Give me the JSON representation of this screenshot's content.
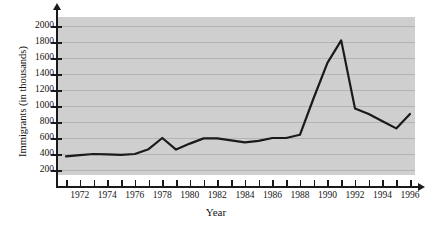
{
  "chart_data": {
    "type": "line",
    "title": "",
    "xlabel": "Year",
    "ylabel": "Immigrants (in thousands)",
    "xlim": [
      1970.5,
      1996.5
    ],
    "ylim": [
      0,
      2100
    ],
    "grid": true,
    "legend": null,
    "y_ticks": [
      200,
      400,
      600,
      800,
      1000,
      1200,
      1400,
      1600,
      1800,
      2000
    ],
    "y_tick_labels": [
      "200",
      "400",
      "600",
      "800",
      "1000",
      "1200",
      "1400",
      "1600",
      "1800",
      "2000"
    ],
    "x_ticks": [
      1971,
      1972,
      1973,
      1974,
      1975,
      1976,
      1977,
      1978,
      1979,
      1980,
      1981,
      1982,
      1983,
      1984,
      1985,
      1986,
      1987,
      1988,
      1989,
      1990,
      1991,
      1992,
      1993,
      1994,
      1995,
      1996
    ],
    "x_tick_labels": [
      "1972",
      "1974",
      "1976",
      "1978",
      "1980",
      "1982",
      "1984",
      "1986",
      "1988",
      "1990",
      "1992",
      "1994",
      "1996"
    ],
    "x_labeled_ticks": [
      1972,
      1974,
      1976,
      1978,
      1980,
      1982,
      1984,
      1986,
      1988,
      1990,
      1992,
      1994,
      1996
    ],
    "series": [
      {
        "name": "Immigrants (in thousands)",
        "color": "#1a1a1a",
        "x": [
          1971,
          1972,
          1973,
          1974,
          1975,
          1976,
          1977,
          1978,
          1979,
          1980,
          1981,
          1982,
          1983,
          1984,
          1985,
          1986,
          1987,
          1988,
          1989,
          1990,
          1991,
          1992,
          1993,
          1994,
          1995,
          1996
        ],
        "values": [
          370,
          385,
          400,
          395,
          390,
          400,
          460,
          600,
          455,
          530,
          595,
          595,
          570,
          545,
          565,
          600,
          600,
          640,
          1100,
          1540,
          1820,
          970,
          900,
          810,
          720,
          900
        ]
      }
    ],
    "colors": {
      "plot_background": "#cfcfcf",
      "gridline": "#b4b4b4",
      "axis": "#1a1a1a",
      "line": "#1a1a1a",
      "text": "#141414",
      "page_background": "#ffffff"
    }
  }
}
